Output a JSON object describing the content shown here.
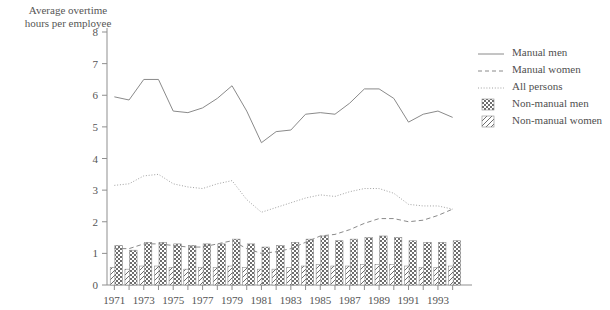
{
  "axis_title": "Average overtime\nhours per employee",
  "legend": {
    "items": [
      {
        "label": "Manual men",
        "key": "solid-line",
        "color": "#8a8a8a"
      },
      {
        "label": "Manual women",
        "key": "dashed-line",
        "color": "#8a8a8a"
      },
      {
        "label": "All persons",
        "key": "dotted-line",
        "color": "#a0a0a0"
      },
      {
        "label": "Non-manual men",
        "key": "checker-swatch",
        "color": "#707070"
      },
      {
        "label": "Non-manual women",
        "key": "diagonal-hatch-swatch",
        "color": "#707070"
      }
    ]
  },
  "chart_data": {
    "type": "line",
    "title": "",
    "xlabel": "",
    "ylabel": "Average overtime hours per employee",
    "ylim": [
      0,
      8
    ],
    "yticks": [
      0,
      1,
      2,
      3,
      4,
      5,
      6,
      7,
      8
    ],
    "grid": false,
    "legend_position": "right",
    "x": [
      1971,
      1972,
      1973,
      1974,
      1975,
      1976,
      1977,
      1978,
      1979,
      1980,
      1981,
      1982,
      1983,
      1984,
      1985,
      1986,
      1987,
      1988,
      1989,
      1990,
      1991,
      1992,
      1993,
      1994
    ],
    "xtick_labels": [
      "1971",
      "",
      "1973",
      "",
      "1975",
      "",
      "1977",
      "",
      "1979",
      "",
      "1981",
      "",
      "1983",
      "",
      "1985",
      "",
      "1987",
      "",
      "1989",
      "",
      "1991",
      "",
      "1993",
      ""
    ],
    "series": [
      {
        "name": "Manual men",
        "style": "solid",
        "type": "line",
        "values": [
          5.95,
          5.85,
          6.5,
          6.5,
          5.5,
          5.45,
          5.6,
          5.9,
          6.3,
          5.5,
          4.5,
          4.85,
          4.9,
          5.4,
          5.45,
          5.4,
          5.75,
          6.2,
          6.2,
          5.9,
          5.15,
          5.4,
          5.5,
          5.3
        ]
      },
      {
        "name": "Manual women",
        "style": "dashed",
        "type": "line",
        "values": [
          1.15,
          1.15,
          1.3,
          1.3,
          1.25,
          1.2,
          1.2,
          1.3,
          1.4,
          1.15,
          1.0,
          1.05,
          1.15,
          1.35,
          1.55,
          1.6,
          1.75,
          1.95,
          2.1,
          2.1,
          2.0,
          2.05,
          2.2,
          2.4
        ]
      },
      {
        "name": "All persons",
        "style": "dotted",
        "type": "line",
        "values": [
          3.15,
          3.2,
          3.45,
          3.5,
          3.2,
          3.1,
          3.05,
          3.2,
          3.3,
          2.7,
          2.3,
          2.45,
          2.6,
          2.75,
          2.85,
          2.8,
          2.95,
          3.05,
          3.05,
          2.9,
          2.55,
          2.5,
          2.5,
          2.4
        ]
      },
      {
        "name": "Non-manual men",
        "style": "checker",
        "type": "bar",
        "values": [
          1.25,
          1.1,
          1.35,
          1.35,
          1.3,
          1.25,
          1.3,
          1.3,
          1.45,
          1.3,
          1.2,
          1.25,
          1.35,
          1.45,
          1.55,
          1.4,
          1.45,
          1.5,
          1.55,
          1.5,
          1.4,
          1.35,
          1.35,
          1.4
        ]
      },
      {
        "name": "Non-manual women",
        "style": "hatch",
        "type": "bar",
        "values": [
          0.55,
          0.5,
          0.6,
          0.6,
          0.55,
          0.5,
          0.55,
          0.55,
          0.6,
          0.55,
          0.5,
          0.5,
          0.55,
          0.6,
          0.65,
          0.6,
          0.6,
          0.65,
          0.65,
          0.65,
          0.6,
          0.55,
          0.55,
          0.6
        ]
      }
    ]
  }
}
